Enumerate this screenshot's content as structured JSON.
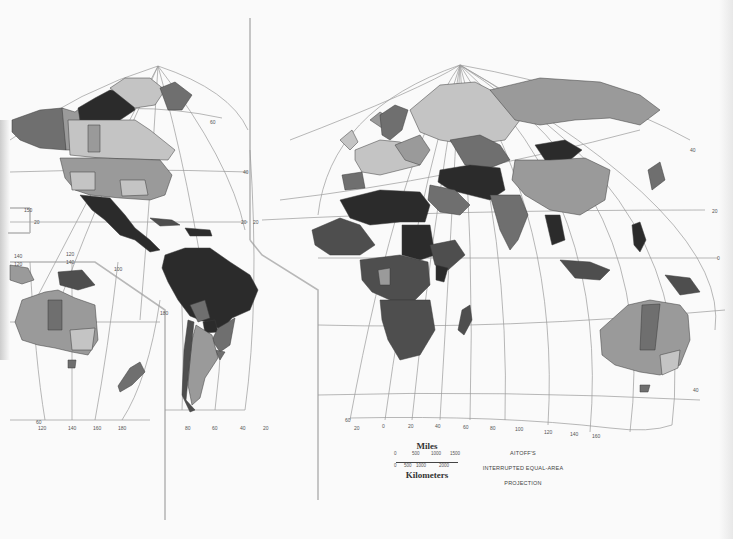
{
  "map": {
    "type": "choropleth world map",
    "projection_title": [
      "AITOFF'S",
      "INTERRUPTED EQUAL-AREA",
      "PROJECTION"
    ],
    "shades": {
      "darkest": "#2b2b2b",
      "dark": "#4e4e4e",
      "medium": "#6f6f6f",
      "light": "#9a9a9a",
      "lightest": "#c4c4c4",
      "water": "#fafafa"
    },
    "scale": {
      "miles_label": "Miles",
      "km_label": "Kilometers",
      "miles_ticks": [
        "0",
        "500",
        "1000",
        "1500"
      ],
      "km_ticks": [
        "0",
        "500",
        "1000",
        "2000"
      ]
    },
    "graticule_labels": {
      "west_bottom_longitudes": [
        "120",
        "140",
        "160",
        "180"
      ],
      "americas_bottom_longitudes": [
        "80",
        "60",
        "40",
        "20"
      ],
      "east_bottom_longitudes": [
        "20",
        "0",
        "20",
        "40",
        "60",
        "80",
        "100",
        "120",
        "140",
        "160"
      ],
      "latitudes": [
        "60",
        "40",
        "20",
        "0",
        "20",
        "40",
        "60"
      ],
      "pacific_labels": [
        "150",
        "20",
        "140",
        "120",
        "100",
        "140",
        "120",
        "180"
      ]
    }
  }
}
